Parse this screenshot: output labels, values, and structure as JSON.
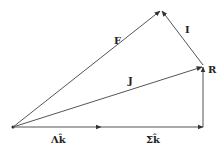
{
  "diagram": {
    "type": "vector-diagram",
    "points": {
      "origin": {
        "x": 13,
        "y": 127
      },
      "mid": {
        "x": 100,
        "y": 127
      },
      "corner": {
        "x": 203,
        "y": 127
      },
      "R": {
        "x": 203,
        "y": 66
      },
      "apex": {
        "x": 161,
        "y": 10
      }
    },
    "vectors": [
      {
        "name": "F",
        "from": "origin",
        "to": "apex"
      },
      {
        "name": "J",
        "from": "origin",
        "to": "R"
      },
      {
        "name": "I",
        "from": "R",
        "to": "apex"
      },
      {
        "name": "Λk̂",
        "from": "origin",
        "to": "mid"
      },
      {
        "name": "Σk̂",
        "from": "mid",
        "to": "corner"
      },
      {
        "name": "vertical",
        "from": "corner",
        "to": "R"
      }
    ],
    "labels": {
      "F": "F",
      "J": "J",
      "I": "I",
      "R": "R",
      "lambda_k": "Λk̂",
      "sigma_k": "Σk̂"
    },
    "color": "#555555"
  }
}
